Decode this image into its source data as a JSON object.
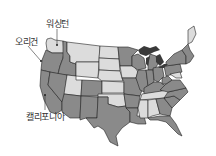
{
  "map": {
    "title": "United States",
    "colors": {
      "dark": "#8a8a8a",
      "light": "#dcdcdc",
      "greatlakes": "#3a3a3a",
      "border": "#222222"
    }
  },
  "labels": {
    "washington": "워싱턴",
    "oregon": "오리건",
    "california": "캘리포니아"
  }
}
